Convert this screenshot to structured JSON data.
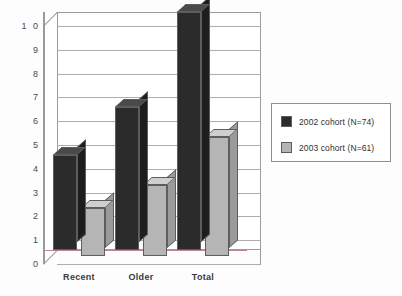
{
  "chart_data": {
    "type": "bar",
    "title": "",
    "subtitle": "",
    "xlabel": "",
    "ylabel": "",
    "categories": [
      "Recent",
      "Older",
      "Total"
    ],
    "series": [
      {
        "name": "2002 cohort (N=74)",
        "values": [
          4,
          6,
          10
        ],
        "color": "#2b2b2b"
      },
      {
        "name": "2003 cohort (N=61)",
        "values": [
          2,
          3,
          5
        ],
        "color": "#b5b5b5"
      }
    ],
    "ylim": [
      0,
      10
    ],
    "yticks": [
      "0",
      "1",
      "2",
      "3",
      "4",
      "5",
      "6",
      "7",
      "8",
      "9",
      "1 0"
    ],
    "grid": true,
    "legend_position": "right",
    "style": "3d-column"
  },
  "legend": {
    "entries": [
      {
        "label": "2002 cohort (N=74)",
        "swatch_color": "#2b2b2b"
      },
      {
        "label": "2003 cohort (N=61)",
        "swatch_color": "#b5b5b5"
      }
    ]
  },
  "axis": {
    "y_tick_labels": [
      "1 0",
      "9",
      "8",
      "7",
      "6",
      "5",
      "4",
      "3",
      "2",
      "1",
      "0"
    ],
    "x_tick_labels": [
      "Recent",
      "Older",
      "Total"
    ]
  },
  "colors": {
    "series_2002": "#2b2b2b",
    "series_2003": "#b5b5b5",
    "gridline": "#adadad",
    "axis_line": "#9a9a9a",
    "background": "#fdfdfd",
    "baseline_tint": "#b8879a"
  }
}
